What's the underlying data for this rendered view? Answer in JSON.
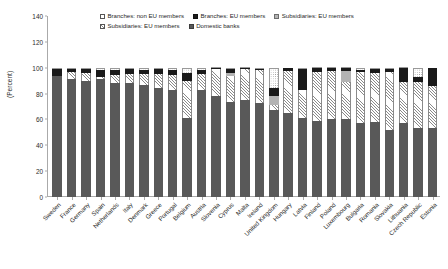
{
  "chart_data": {
    "type": "bar",
    "subtype": "stacked-bar-100",
    "title": "",
    "xlabel": "",
    "ylabel": "(Percent)",
    "ylim": [
      0,
      140
    ],
    "yticks": [
      0,
      20,
      40,
      60,
      80,
      100,
      120,
      140
    ],
    "grid": false,
    "legend_position": "top",
    "legend": [
      "Branches: non EU members",
      "Branches: EU members",
      "Subsidiaries: EU members",
      "Subsidiaries: EU members",
      "Domestic banks"
    ],
    "categories": [
      "Sweden",
      "France",
      "Germany",
      "Spain",
      "Netherlands",
      "Italy",
      "Denmark",
      "Greece",
      "Portugal",
      "Belgium",
      "Austria",
      "Slovenia",
      "Cyprus",
      "Malta",
      "Ireland",
      "United Kingdom",
      "Hungary",
      "Latvia",
      "Finland",
      "Poland",
      "Luxembourg",
      "Bulgaria",
      "Romania",
      "Slovakia",
      "Lithuania",
      "Czech Republic",
      "Estonia"
    ],
    "series": [
      {
        "name": "Domestic banks",
        "key": "domestic",
        "color": "#595959",
        "pattern": "solid-dark-gray",
        "values": [
          93.5,
          91.0,
          89.5,
          91.0,
          88.5,
          88.5,
          87.0,
          84.0,
          82.5,
          61.0,
          82.5,
          78.0,
          73.5,
          75.0,
          72.5,
          67.0,
          65.0,
          61.0,
          58.5,
          60.5,
          60.0,
          57.0,
          58.0,
          51.5,
          57.5,
          53.0,
          53.0
        ]
      },
      {
        "name": "Subsidiaries: EU members",
        "key": "subs_eu_hatch",
        "color": "#ffffff",
        "pattern": "diagonal-hatch",
        "values": [
          0.0,
          5.5,
          6.5,
          1.5,
          6.0,
          6.5,
          8.5,
          11.0,
          12.0,
          29.0,
          13.0,
          21.0,
          20.0,
          24.0,
          26.0,
          4.0,
          32.5,
          21.5,
          38.5,
          37.0,
          29.0,
          39.5,
          38.0,
          45.5,
          31.5,
          36.0,
          32.5
        ]
      },
      {
        "name": "Subsidiaries: EU members",
        "key": "subs_eu_gray",
        "color": "#b3b3b3",
        "pattern": "solid-light-gray",
        "values": [
          0.0,
          0.0,
          0.0,
          0.0,
          0.0,
          0.0,
          0.0,
          0.0,
          0.0,
          0.0,
          0.0,
          0.0,
          2.5,
          0.0,
          0.0,
          7.0,
          0.0,
          0.0,
          0.0,
          0.0,
          8.5,
          0.0,
          0.0,
          0.0,
          0.0,
          0.0,
          0.0
        ]
      },
      {
        "name": "Branches: EU members",
        "key": "branches_eu",
        "color": "#1a1a1a",
        "pattern": "solid-black",
        "values": [
          5.5,
          2.5,
          3.0,
          5.5,
          4.0,
          4.0,
          3.0,
          4.0,
          4.0,
          6.0,
          3.0,
          0.5,
          3.0,
          0.5,
          0.5,
          6.0,
          2.5,
          16.5,
          2.5,
          2.0,
          2.0,
          1.5,
          3.0,
          2.0,
          10.5,
          3.5,
          14.5
        ]
      },
      {
        "name": "Branches: non EU members",
        "key": "branches_non_eu",
        "color": "#ffffff",
        "pattern": "dotted",
        "values": [
          1.0,
          1.0,
          1.0,
          2.0,
          1.5,
          1.0,
          1.5,
          1.0,
          1.5,
          4.0,
          1.5,
          0.5,
          1.0,
          0.5,
          1.0,
          16.0,
          0.0,
          1.0,
          0.5,
          0.5,
          0.5,
          2.0,
          1.0,
          1.0,
          0.5,
          7.5,
          0.0
        ]
      }
    ]
  },
  "legend": {
    "row1": [
      {
        "label": "Branches: non EU members",
        "swatch": "sw-branches-non-eu"
      },
      {
        "label": "Branches: EU members",
        "swatch": "sw-branches-eu"
      },
      {
        "label": "Subsidiaries: EU members",
        "swatch": "sw-subs-eu-gray"
      }
    ],
    "row2": [
      {
        "label": "Subsidiaries: EU members",
        "swatch": "sw-subs-eu-hatch"
      },
      {
        "label": "Domestic banks",
        "swatch": "sw-domestic"
      }
    ]
  }
}
